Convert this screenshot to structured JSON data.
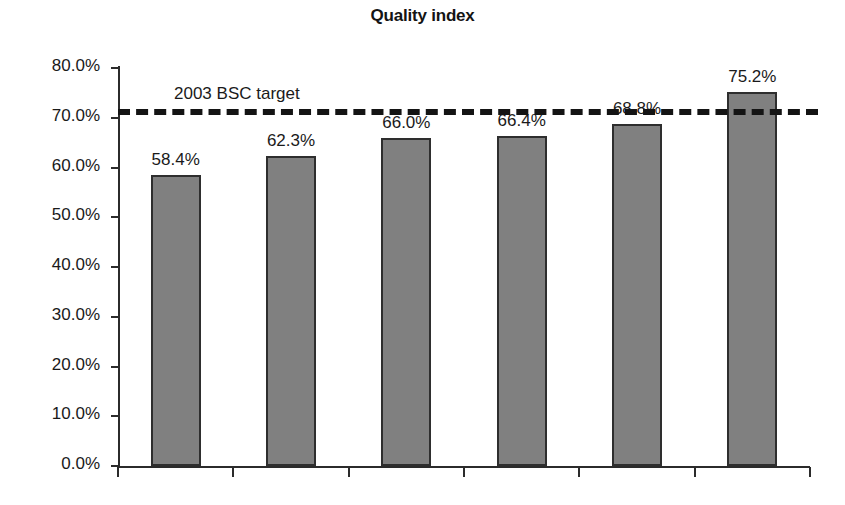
{
  "chart_data": {
    "type": "bar",
    "title": "Quality index",
    "xlabel": "",
    "ylabel": "",
    "categories": [
      "",
      "",
      "",
      "",
      "",
      ""
    ],
    "values": [
      58.4,
      62.3,
      66.0,
      66.4,
      68.8,
      75.2
    ],
    "value_labels": [
      "58.4%",
      "62.3%",
      "66.0%",
      "66.4%",
      "68.8%",
      "75.2%"
    ],
    "ylim": [
      0,
      80
    ],
    "ytick_values": [
      0,
      10,
      20,
      30,
      40,
      50,
      60,
      70,
      80
    ],
    "ytick_labels": [
      "0.0%",
      "10.0%",
      "20.0%",
      "30.0%",
      "40.0%",
      "50.0%",
      "60.0%",
      "70.0%",
      "80.0%"
    ],
    "grid": false,
    "legend": "none",
    "bar_color": "#808080",
    "bar_border_color": "#2e2e2e",
    "axis_color": "#2b2b2b",
    "text_color": "#1a1a1a",
    "annotations": [
      {
        "name": "target-line",
        "label": "2003 BSC target",
        "value": 70.0,
        "style": "dashed",
        "color": "#141414"
      }
    ]
  }
}
